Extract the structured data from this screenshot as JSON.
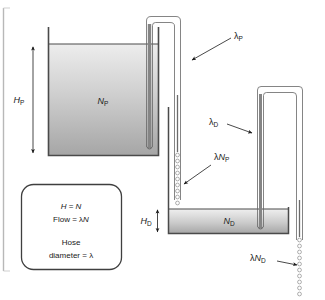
{
  "diagram": {
    "labels": {
      "tank_upper_symbol": "N",
      "tank_upper_sub": "P",
      "tank_lower_symbol": "N",
      "tank_lower_sub": "D",
      "height_upper_symbol": "H",
      "height_upper_sub": "P",
      "height_lower_symbol": "H",
      "height_lower_sub": "D",
      "hose_upper": "λ",
      "hose_upper_sub": "P",
      "hose_lower": "λ",
      "hose_lower_sub": "D",
      "flow_upper_lambda": "λ",
      "flow_upper_symbol": "N",
      "flow_upper_sub": "P",
      "flow_lower_lambda": "λ",
      "flow_lower_symbol": "N",
      "flow_lower_sub": "D"
    },
    "legend": {
      "line1_left": "H",
      "line1_eq": " = ",
      "line1_right": "N",
      "line2_left": "Flow",
      "line2_eq": " = ",
      "line2_lambda": "λ",
      "line2_right": "N",
      "line3": "Hose",
      "line4_left": "diameter",
      "line4_eq": " = ",
      "line4_right": "λ"
    },
    "colors": {
      "water_top": "#ececec",
      "water_bottom": "#a9a9a9",
      "outline": "#4a4a4a",
      "hose": "#777777",
      "text": "#1a1a1a"
    }
  }
}
